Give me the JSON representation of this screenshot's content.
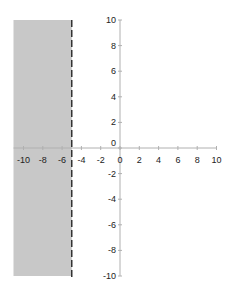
{
  "chart_data": {
    "type": "area",
    "title": "",
    "xlabel": "",
    "ylabel": "",
    "xlim": [
      -10,
      10
    ],
    "ylim": [
      -10,
      10
    ],
    "x_ticks": [
      -10,
      -8,
      -6,
      -4,
      -2,
      0,
      2,
      4,
      6,
      8,
      10
    ],
    "y_ticks": [
      10,
      8,
      6,
      4,
      2,
      0,
      -2,
      -4,
      -6,
      -8,
      -10
    ],
    "grid": false,
    "legend": null,
    "shaded_region": {
      "x_from": -10,
      "x_to": -5,
      "y_from": -10,
      "y_to": 10,
      "color": "#c8c8c8"
    },
    "boundary_line": {
      "x": -5,
      "style": "dashed",
      "color": "#333333"
    }
  },
  "colors": {
    "shade": "#c8c8c8",
    "axis": "#b0b0b0",
    "dash": "#333333"
  }
}
